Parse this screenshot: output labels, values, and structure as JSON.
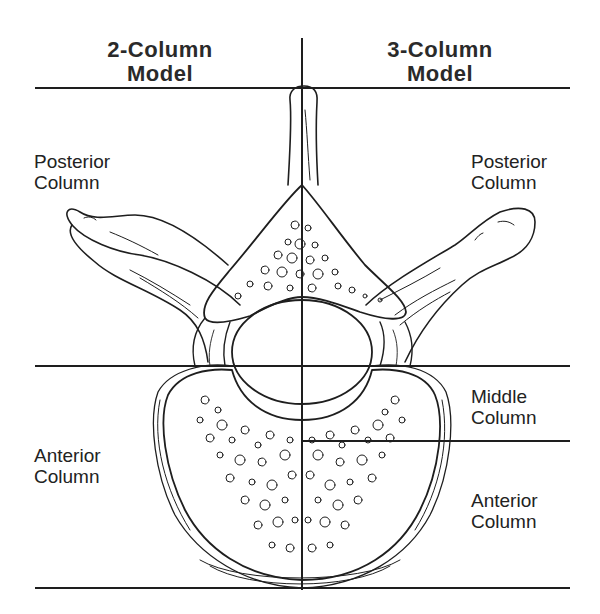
{
  "headers": {
    "left": {
      "line1": "2-Column",
      "line2": "Model"
    },
    "right": {
      "line1": "3-Column",
      "line2": "Model"
    }
  },
  "left_labels": {
    "posterior": {
      "line1": "Posterior",
      "line2": "Column"
    },
    "anterior": {
      "line1": "Anterior",
      "line2": "Column"
    }
  },
  "right_labels": {
    "posterior": {
      "line1": "Posterior",
      "line2": "Column"
    },
    "middle": {
      "line1": "Middle",
      "line2": "Column"
    },
    "anterior": {
      "line1": "Anterior",
      "line2": "Column"
    }
  },
  "figure": {
    "divider_lines": {
      "vertical_x": 302,
      "top_y": 88,
      "posterior_anterior_y": 366,
      "middle_anterior_y": 441,
      "bottom_y": 588
    },
    "line_color": "#1e1e1e"
  }
}
